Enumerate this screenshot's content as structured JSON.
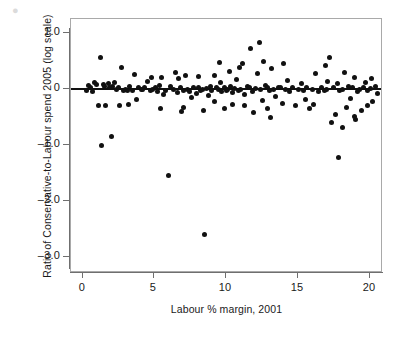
{
  "figure": {
    "artifact_glyph": "●",
    "background": "#ffffff",
    "point_color": "#111111",
    "frame_color": "#a9a9a9"
  },
  "axes": {
    "y_title": "Ratio of Conservative-to-Labour spend 2005 (log scale)",
    "x_title": "Labour % margin, 2001",
    "y_ticks": [
      "1.0",
      "0",
      "–1.0",
      "–2.0",
      "–3.0"
    ],
    "x_ticks": [
      "0",
      "5",
      "10",
      "15",
      "20"
    ]
  },
  "chart_data": {
    "type": "scatter",
    "title": "",
    "xlabel": "Labour % margin, 2001",
    "ylabel": "Ratio of Conservative-to-Labour spend 2005 (log scale)",
    "xlim": [
      -0.8,
      20.9
    ],
    "ylim": [
      -3.28,
      1.25
    ],
    "xticks": [
      0,
      5,
      10,
      15,
      20
    ],
    "yticks": [
      1.0,
      0,
      -1.0,
      -2.0,
      -3.0
    ],
    "grid": false,
    "legend": null,
    "reference_lines": [
      {
        "name": "zero-line",
        "orientation": "horizontal",
        "y": 0,
        "color": "#111111",
        "width": 2
      }
    ],
    "marker": {
      "shape": "circle",
      "filled": true,
      "size": 5,
      "color": "#111111"
    },
    "points": [
      [
        0.55,
        0.02
      ],
      [
        0.7,
        -0.04
      ],
      [
        0.85,
        0.12
      ],
      [
        1.0,
        0.08
      ],
      [
        1.1,
        -0.3
      ],
      [
        1.25,
        0.57
      ],
      [
        1.3,
        -1.0
      ],
      [
        1.45,
        0.09
      ],
      [
        1.55,
        0.05
      ],
      [
        1.6,
        -0.29
      ],
      [
        1.8,
        0.1
      ],
      [
        2.0,
        -0.85
      ],
      [
        2.1,
        0.04
      ],
      [
        2.25,
        0.11
      ],
      [
        2.35,
        0.0
      ],
      [
        2.5,
        0.02
      ],
      [
        2.7,
        0.38
      ],
      [
        2.85,
        -0.02
      ],
      [
        3.0,
        0.0
      ],
      [
        3.15,
        -0.03
      ],
      [
        3.3,
        0.05
      ],
      [
        3.45,
        -0.02
      ],
      [
        3.6,
        0.26
      ],
      [
        3.75,
        -0.18
      ],
      [
        3.9,
        0.02
      ],
      [
        4.1,
        -0.01
      ],
      [
        4.3,
        0.03
      ],
      [
        4.5,
        0.14
      ],
      [
        4.7,
        -0.03
      ],
      [
        4.9,
        0.0
      ],
      [
        5.05,
        0.02
      ],
      [
        5.2,
        -0.05
      ],
      [
        5.35,
        0.06
      ],
      [
        5.5,
        0.21
      ],
      [
        5.6,
        -0.1
      ],
      [
        5.8,
        -0.02
      ],
      [
        6.0,
        -1.55
      ],
      [
        6.15,
        0.04
      ],
      [
        6.3,
        0.0
      ],
      [
        6.45,
        0.3
      ],
      [
        6.6,
        -0.06
      ],
      [
        6.8,
        0.02
      ],
      [
        7.0,
        -0.02
      ],
      [
        7.15,
        0.24
      ],
      [
        7.3,
        0.0
      ],
      [
        7.45,
        -0.05
      ],
      [
        7.6,
        -0.15
      ],
      [
        7.75,
        0.02
      ],
      [
        7.9,
        -0.08
      ],
      [
        8.05,
        0.03
      ],
      [
        8.2,
        -0.03
      ],
      [
        8.35,
        0.0
      ],
      [
        8.5,
        -2.6
      ],
      [
        8.6,
        0.01
      ],
      [
        8.75,
        -0.12
      ],
      [
        8.9,
        0.04
      ],
      [
        9.0,
        -0.02
      ],
      [
        9.15,
        -0.22
      ],
      [
        9.3,
        0.02
      ],
      [
        9.45,
        0.0
      ],
      [
        9.6,
        0.12
      ],
      [
        9.7,
        -0.05
      ],
      [
        9.85,
        0.03
      ],
      [
        10.0,
        -0.03
      ],
      [
        10.1,
        0.0
      ],
      [
        10.2,
        0.32
      ],
      [
        10.3,
        0.04
      ],
      [
        10.45,
        -0.06
      ],
      [
        10.6,
        0.01
      ],
      [
        10.7,
        0.17
      ],
      [
        10.85,
        -0.02
      ],
      [
        11.0,
        0.0
      ],
      [
        11.15,
        0.45
      ],
      [
        11.3,
        -0.1
      ],
      [
        11.45,
        0.05
      ],
      [
        11.6,
        0.02
      ],
      [
        11.7,
        0.72
      ],
      [
        11.85,
        -0.04
      ],
      [
        12.0,
        0.01
      ],
      [
        12.15,
        0.28
      ],
      [
        12.3,
        0.83
      ],
      [
        12.4,
        0.0
      ],
      [
        12.55,
        -0.2
      ],
      [
        12.7,
        0.06
      ],
      [
        12.85,
        0.02
      ],
      [
        13.0,
        -0.03
      ],
      [
        13.15,
        0.36
      ],
      [
        13.3,
        0.0
      ],
      [
        13.45,
        -0.14
      ],
      [
        13.6,
        0.03
      ],
      [
        13.75,
        0.02
      ],
      [
        13.9,
        -0.25
      ],
      [
        14.1,
        0.0
      ],
      [
        14.25,
        0.15
      ],
      [
        14.4,
        -0.05
      ],
      [
        14.6,
        0.02
      ],
      [
        14.8,
        -0.3
      ],
      [
        15.0,
        0.0
      ],
      [
        15.2,
        0.1
      ],
      [
        15.4,
        -0.03
      ],
      [
        15.6,
        0.02
      ],
      [
        15.8,
        -0.35
      ],
      [
        16.0,
        0.0
      ],
      [
        16.2,
        0.27
      ],
      [
        16.4,
        -0.05
      ],
      [
        16.6,
        0.03
      ],
      [
        16.8,
        -0.02
      ],
      [
        17.0,
        0.0
      ],
      [
        17.15,
        0.56
      ],
      [
        17.3,
        -0.6
      ],
      [
        17.45,
        0.02
      ],
      [
        17.6,
        -0.45
      ],
      [
        17.75,
        0.1
      ],
      [
        17.8,
        -1.22
      ],
      [
        17.9,
        -0.02
      ],
      [
        18.05,
        0.0
      ],
      [
        18.2,
        0.3
      ],
      [
        18.35,
        -0.32
      ],
      [
        18.5,
        0.04
      ],
      [
        18.65,
        -0.16
      ],
      [
        18.8,
        0.02
      ],
      [
        18.95,
        0.21
      ],
      [
        19.1,
        -0.05
      ],
      [
        19.25,
        0.0
      ],
      [
        19.4,
        -0.38
      ],
      [
        19.55,
        0.03
      ],
      [
        19.7,
        0.12
      ],
      [
        19.85,
        -0.02
      ],
      [
        20.0,
        0.01
      ],
      [
        20.2,
        -0.22
      ],
      [
        20.4,
        0.05
      ],
      [
        20.55,
        -0.08
      ],
      [
        0.3,
        -0.02
      ],
      [
        0.45,
        0.06
      ],
      [
        2.6,
        -0.3
      ],
      [
        4.15,
        0.0
      ],
      [
        6.9,
        -0.4
      ],
      [
        9.9,
        -0.35
      ],
      [
        11.9,
        -0.42
      ],
      [
        13.05,
        -0.5
      ],
      [
        16.9,
        0.42
      ],
      [
        18.1,
        -0.68
      ],
      [
        19.0,
        -0.55
      ],
      [
        20.1,
        0.18
      ],
      [
        12.6,
        0.5
      ],
      [
        10.9,
        0.38
      ],
      [
        9.55,
        0.48
      ],
      [
        8.45,
        -0.38
      ],
      [
        7.05,
        -0.33
      ],
      [
        5.45,
        -0.34
      ],
      [
        3.2,
        -0.28
      ],
      [
        1.9,
        0.03
      ],
      [
        14.0,
        0.45
      ],
      [
        15.5,
        -0.18
      ],
      [
        16.1,
        -0.28
      ],
      [
        17.05,
        0.14
      ],
      [
        18.9,
        -0.48
      ],
      [
        19.8,
        -0.3
      ],
      [
        11.25,
        -0.3
      ],
      [
        12.9,
        -0.35
      ],
      [
        10.4,
        -0.28
      ],
      [
        9.2,
        0.25
      ],
      [
        8.1,
        0.22
      ],
      [
        6.7,
        0.18
      ],
      [
        4.8,
        0.2
      ]
    ]
  }
}
